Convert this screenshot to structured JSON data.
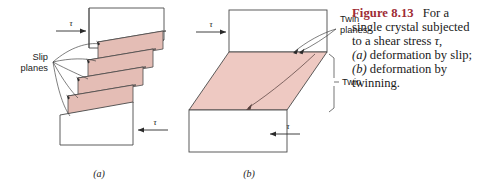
{
  "figure": {
    "caption": {
      "head": "Figure 8.13",
      "line1": "For a",
      "line2": "single crystal subjected",
      "line3_pre": "to a shear stress ",
      "line3_tau": "τ",
      "line3_post": ",",
      "line4_a": "(a)",
      "line4_rest": " deformation by slip;",
      "line5_b": "(b)",
      "line5_rest": " deformation by",
      "line6": "twinning."
    },
    "panel_a": {
      "sublabel": "(a)",
      "callout_line1": "Slip",
      "callout_line2": "planes",
      "stress_top": "τ",
      "stress_bottom": "τ",
      "slab_count": 4
    },
    "panel_b": {
      "sublabel": "(b)",
      "callout_line1": "Twin",
      "callout_line2": "planes",
      "bracket_label": "Twin",
      "stress_top": "τ",
      "stress_bottom": "τ"
    },
    "colors": {
      "slab_fill": "#e4bdb5",
      "slab_fill_light": "#eecdc6",
      "twin_fill": "#eec9c2",
      "outline": "#4a4a4a",
      "leader": "#3a3a3a",
      "caption_head": "#9e2b34",
      "text": "#1a1a1a",
      "background": "#ffffff"
    }
  }
}
